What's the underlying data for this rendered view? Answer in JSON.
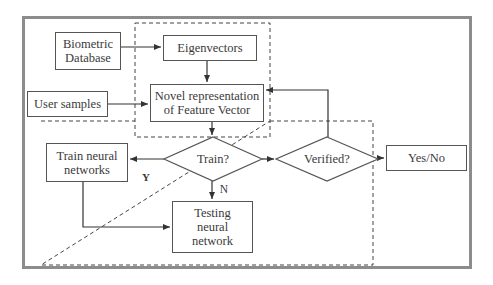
{
  "diagram": {
    "type": "flowchart",
    "nodes": {
      "biometric_database": {
        "line1": "Biometric",
        "line2": "Database"
      },
      "eigenvectors": {
        "label": "Eigenvectors"
      },
      "user_samples": {
        "label": "User samples"
      },
      "novel_representation": {
        "line1": "Novel representation",
        "line2": "of Feature Vector"
      },
      "train_decision": {
        "label": "Train?"
      },
      "verified_decision": {
        "label": "Verified?"
      },
      "yes_no": {
        "label": "Yes/No"
      },
      "train_neural_networks": {
        "line1": "Train neural",
        "line2": "networks"
      },
      "testing_neural_network": {
        "line1": "Testing",
        "line2": "neural",
        "line3": "network"
      }
    },
    "edge_labels": {
      "yes": "Y",
      "no": "N"
    },
    "edges": [
      {
        "from": "Biometric Database",
        "to": "Eigenvectors"
      },
      {
        "from": "Eigenvectors",
        "to": "Novel representation of Feature Vector"
      },
      {
        "from": "User samples",
        "to": "Novel representation of Feature Vector"
      },
      {
        "from": "Novel representation of Feature Vector",
        "to": "Train?"
      },
      {
        "from": "Train?",
        "to": "Train neural networks",
        "label": "Y"
      },
      {
        "from": "Train?",
        "to": "Testing neural network",
        "label": "N"
      },
      {
        "from": "Train neural networks",
        "to": "Testing neural network"
      },
      {
        "from": "Train?",
        "to": "Verified?"
      },
      {
        "from": "Verified?",
        "to": "Novel representation of Feature Vector"
      },
      {
        "from": "Verified?",
        "to": "Yes/No"
      }
    ],
    "colors": {
      "frame": "#8c8c8c",
      "lines": "#444444",
      "text": "#3a3a3a"
    }
  }
}
